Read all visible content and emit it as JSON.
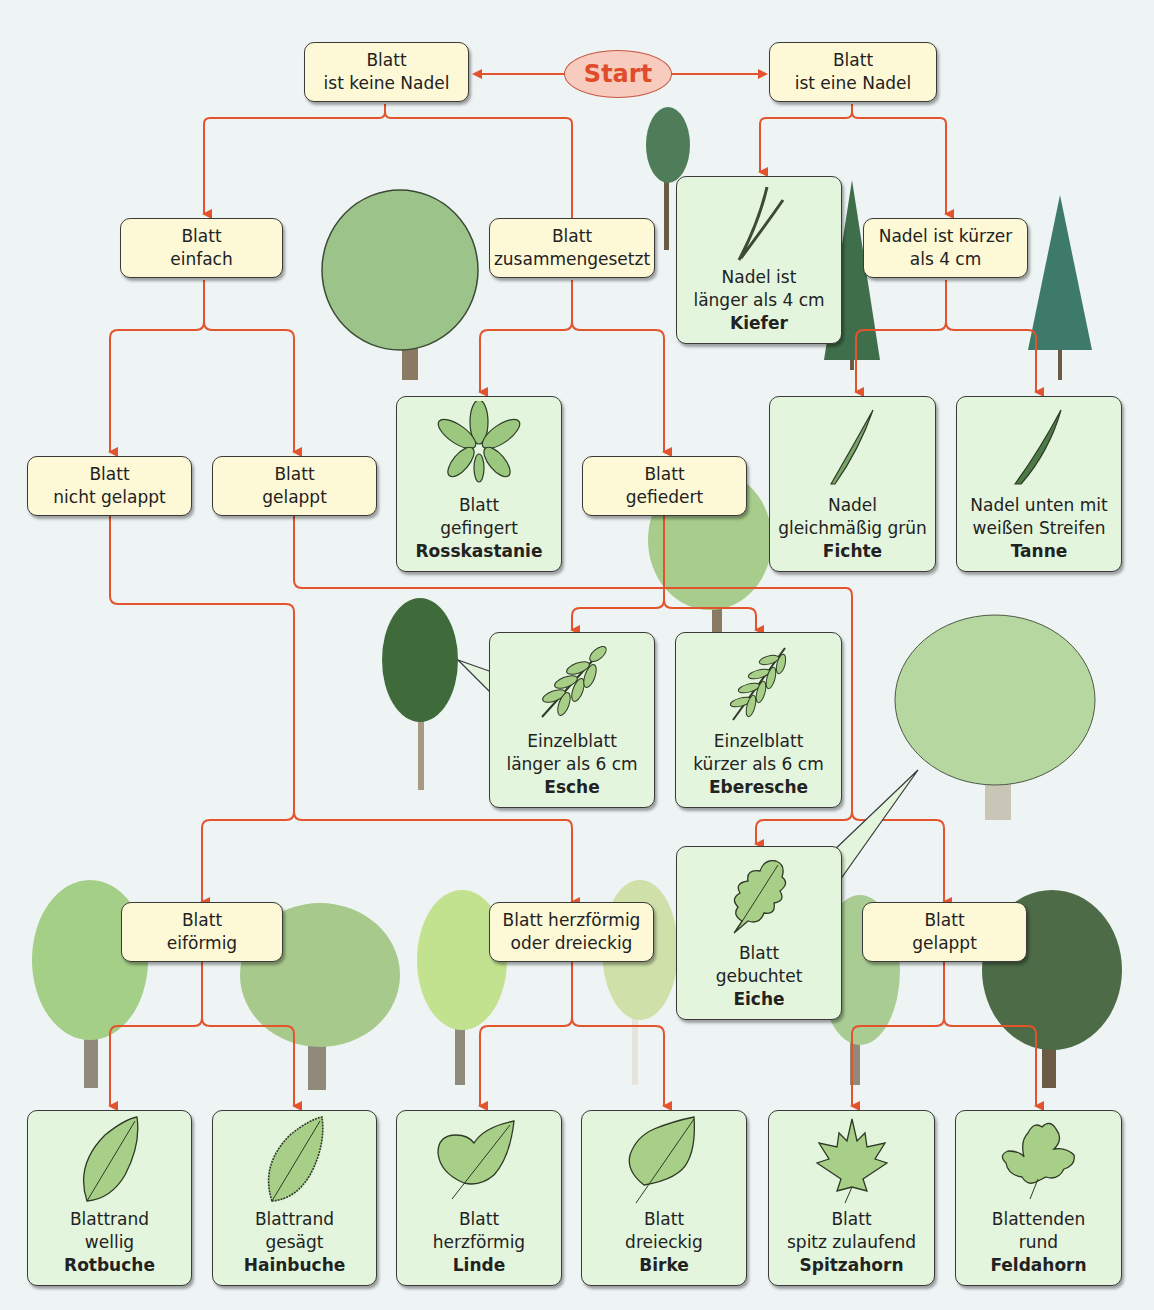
{
  "start": {
    "label": "Start"
  },
  "colors": {
    "arrow": "#e2532e",
    "question_bg": "#fdf8d6",
    "answer_bg": "#e3f5dc",
    "background": "#eef3f3",
    "start_fill": "#f7cbbd",
    "start_text": "#e04b2a"
  },
  "questions": {
    "keine_nadel": {
      "l1": "Blatt",
      "l2": "ist keine Nadel"
    },
    "eine_nadel": {
      "l1": "Blatt",
      "l2": "ist eine Nadel"
    },
    "einfach": {
      "l1": "Blatt",
      "l2": "einfach"
    },
    "zusammengesetzt": {
      "l1": "Blatt",
      "l2": "zusammengesetzt"
    },
    "nadel_kuerzer": {
      "l1": "Nadel ist kürzer",
      "l2": "als 4 cm"
    },
    "nicht_gelappt": {
      "l1": "Blatt",
      "l2": "nicht gelappt"
    },
    "gelappt": {
      "l1": "Blatt",
      "l2": "gelappt"
    },
    "gefiedert": {
      "l1": "Blatt",
      "l2": "gefiedert"
    },
    "eifoermig": {
      "l1": "Blatt",
      "l2": "eiförmig"
    },
    "herzfoermig_dreieckig": {
      "l1": "Blatt herzförmig",
      "l2": "oder dreieckig"
    },
    "gelappt2": {
      "l1": "Blatt",
      "l2": "gelappt"
    }
  },
  "answers": {
    "kiefer": {
      "l1": "Nadel ist",
      "l2": "länger als 4 cm",
      "name": "Kiefer",
      "icon": "pine-needle-pair-icon"
    },
    "rosskastanie": {
      "l1": "Blatt",
      "l2": "gefingert",
      "name": "Rosskastanie",
      "icon": "palmate-leaf-icon"
    },
    "fichte": {
      "l1": "Nadel",
      "l2": "gleichmäßig grün",
      "name": "Fichte",
      "icon": "spruce-needle-icon"
    },
    "tanne": {
      "l1": "Nadel unten mit",
      "l2": "weißen Streifen",
      "name": "Tanne",
      "icon": "fir-needle-icon"
    },
    "esche": {
      "l1": "Einzelblatt",
      "l2": "länger als 6 cm",
      "name": "Esche",
      "icon": "pinnate-leaf-icon"
    },
    "eberesche": {
      "l1": "Einzelblatt",
      "l2": "kürzer als 6 cm",
      "name": "Eberesche",
      "icon": "pinnate-leaf-small-icon"
    },
    "eiche": {
      "l1": "Blatt",
      "l2": "gebuchtet",
      "name": "Eiche",
      "icon": "oak-leaf-icon"
    },
    "rotbuche": {
      "l1": "Blattrand",
      "l2": "wellig",
      "name": "Rotbuche",
      "icon": "beech-leaf-icon"
    },
    "hainbuche": {
      "l1": "Blattrand",
      "l2": "gesägt",
      "name": "Hainbuche",
      "icon": "hornbeam-leaf-icon"
    },
    "linde": {
      "l1": "Blatt",
      "l2": "herzförmig",
      "name": "Linde",
      "icon": "linden-leaf-icon"
    },
    "birke": {
      "l1": "Blatt",
      "l2": "dreieckig",
      "name": "Birke",
      "icon": "birch-leaf-icon"
    },
    "spitzahorn": {
      "l1": "Blatt",
      "l2": "spitz zulaufend",
      "name": "Spitzahorn",
      "icon": "norway-maple-leaf-icon"
    },
    "feldahorn": {
      "l1": "Blattenden",
      "l2": "rund",
      "name": "Feldahorn",
      "icon": "field-maple-leaf-icon"
    }
  }
}
